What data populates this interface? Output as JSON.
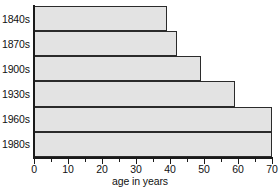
{
  "chart_data": {
    "type": "bar",
    "orientation": "horizontal",
    "title": "",
    "subtitle": "",
    "xlabel": "age in years",
    "ylabel": "",
    "categories": [
      "1840s",
      "1870s",
      "1900s",
      "1930s",
      "1960s",
      "1980s"
    ],
    "values": [
      39,
      42,
      49,
      59,
      70,
      70
    ],
    "series": [
      {
        "name": "age in years",
        "values": [
          39,
          42,
          49,
          59,
          70,
          70
        ]
      }
    ],
    "xlim": [
      0,
      70
    ],
    "x_axis_max_drawn": 70,
    "xticks": [
      0,
      10,
      20,
      30,
      40,
      50,
      60,
      70
    ],
    "xtick_labels": [
      "0",
      "10",
      "20",
      "30",
      "40",
      "50",
      "60",
      "70"
    ],
    "x_minor_ticks": [
      5,
      15,
      25,
      35,
      45,
      55,
      65
    ],
    "grid": false,
    "legend": false,
    "legend_position": "none",
    "bar_fill_color": "#e3e3e3",
    "bar_border_color": "#2b2b2b",
    "axis_color": "#1a1a1a",
    "background_color": "#ffffff",
    "annotations": []
  }
}
